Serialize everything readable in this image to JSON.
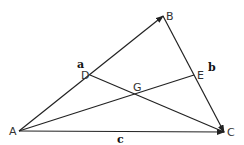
{
  "diagram": {
    "type": "triangle-vectors",
    "points": {
      "A": {
        "label": "A",
        "x": 19,
        "y": 131
      },
      "B": {
        "label": "B",
        "x": 163,
        "y": 16
      },
      "C": {
        "label": "C",
        "x": 224,
        "y": 132
      },
      "D": {
        "label": "D",
        "x": 90,
        "y": 75
      },
      "E": {
        "label": "E",
        "x": 194,
        "y": 75
      },
      "G": {
        "label": "G",
        "x": 137,
        "y": 94
      }
    },
    "vector_labels": {
      "a": "a",
      "b": "b",
      "c": "c"
    },
    "segments": [
      {
        "from": "A",
        "to": "B",
        "arrow": true
      },
      {
        "from": "B",
        "to": "C",
        "arrow": true
      },
      {
        "from": "A",
        "to": "C",
        "arrow": true
      },
      {
        "from": "A",
        "to": "E",
        "arrow": false
      },
      {
        "from": "D",
        "to": "C",
        "arrow": false
      }
    ],
    "colors": {
      "line": "#222222",
      "background": "#ffffff"
    }
  }
}
